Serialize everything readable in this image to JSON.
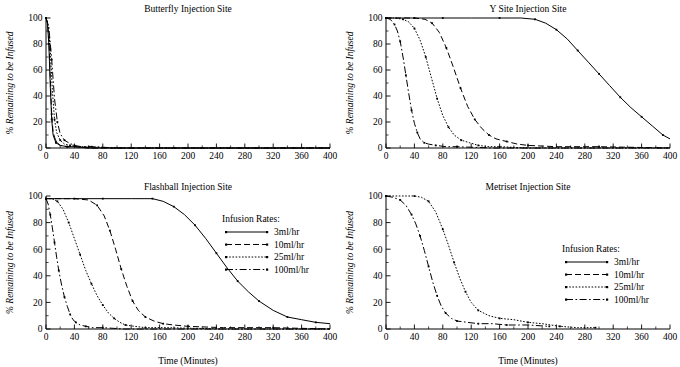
{
  "figure": {
    "xlabel": "Time (Minutes)",
    "ylabel": "% Remaining to be Infused",
    "legend_title": "Infusion Rates:",
    "xticks": [
      0,
      40,
      80,
      120,
      160,
      200,
      240,
      280,
      320,
      360,
      400
    ],
    "yticks": [
      0,
      20,
      40,
      60,
      80,
      100
    ],
    "xlim": [
      0,
      400
    ],
    "ylim": [
      0,
      100
    ],
    "line_color": "#000000"
  },
  "chart_data": [
    {
      "type": "line",
      "title": "Butterfly Injection Site",
      "xlabel": "",
      "ylabel": "% Remaining to be Infused",
      "xlim": [
        0,
        400
      ],
      "ylim": [
        0,
        100
      ],
      "legend_position": "none",
      "grid": false,
      "series": [
        {
          "name": "3ml/hr",
          "style": "solid",
          "x": [
            0,
            2,
            4,
            6,
            8,
            10,
            14,
            20,
            30,
            40,
            60,
            100,
            200,
            300,
            400
          ],
          "y": [
            100,
            96,
            80,
            48,
            22,
            10,
            4,
            2,
            1,
            1,
            0,
            0,
            0,
            0,
            0
          ]
        },
        {
          "name": "10ml/hr",
          "style": "dashed",
          "x": [
            0,
            2,
            4,
            6,
            8,
            10,
            14,
            20,
            30,
            40,
            60,
            100,
            200,
            300,
            400
          ],
          "y": [
            100,
            97,
            85,
            55,
            26,
            12,
            5,
            2,
            1,
            1,
            0,
            0,
            0,
            0,
            0
          ]
        },
        {
          "name": "25ml/hr",
          "style": "dotted",
          "x": [
            0,
            3,
            6,
            9,
            12,
            15,
            20,
            26,
            34,
            44,
            60,
            100,
            200,
            300,
            400
          ],
          "y": [
            100,
            95,
            76,
            44,
            22,
            12,
            6,
            3,
            2,
            1,
            1,
            0,
            0,
            0,
            0
          ]
        },
        {
          "name": "100ml/hr",
          "style": "dashdot",
          "x": [
            0,
            4,
            8,
            12,
            16,
            20,
            26,
            32,
            40,
            50,
            64,
            100,
            200,
            300,
            400
          ],
          "y": [
            100,
            93,
            68,
            38,
            20,
            11,
            6,
            4,
            2,
            1,
            1,
            0,
            0,
            0,
            0
          ]
        }
      ]
    },
    {
      "type": "line",
      "title": "Y Site Injection Site",
      "xlabel": "",
      "ylabel": "% Remaining to be Infused",
      "xlim": [
        0,
        400
      ],
      "ylim": [
        0,
        100
      ],
      "legend_position": "none",
      "grid": false,
      "series": [
        {
          "name": "3ml/hr",
          "style": "solid",
          "x": [
            0,
            40,
            80,
            120,
            160,
            190,
            210,
            225,
            240,
            255,
            270,
            285,
            300,
            315,
            330,
            345,
            360,
            375,
            390,
            400
          ],
          "y": [
            100,
            100,
            100,
            100,
            100,
            100,
            99,
            96,
            91,
            84,
            75,
            66,
            57,
            48,
            39,
            31,
            24,
            17,
            10,
            7
          ]
        },
        {
          "name": "10ml/hr",
          "style": "dashed",
          "x": [
            0,
            20,
            40,
            55,
            65,
            75,
            85,
            95,
            105,
            115,
            125,
            135,
            145,
            155,
            170,
            185,
            200,
            240,
            300,
            400
          ],
          "y": [
            100,
            100,
            100,
            99,
            96,
            89,
            77,
            62,
            46,
            32,
            22,
            15,
            10,
            7,
            5,
            3,
            2,
            1,
            1,
            0
          ]
        },
        {
          "name": "25ml/hr",
          "style": "dotted",
          "x": [
            0,
            12,
            24,
            32,
            40,
            48,
            56,
            64,
            72,
            80,
            88,
            96,
            106,
            118,
            130,
            145,
            160,
            200,
            300,
            400
          ],
          "y": [
            100,
            100,
            99,
            97,
            92,
            83,
            70,
            54,
            38,
            25,
            16,
            10,
            6,
            4,
            2,
            1,
            1,
            0,
            0,
            0
          ]
        },
        {
          "name": "100ml/hr",
          "style": "dashdot",
          "x": [
            0,
            6,
            12,
            16,
            20,
            24,
            28,
            32,
            36,
            40,
            44,
            48,
            54,
            60,
            70,
            85,
            100,
            150,
            250,
            400
          ],
          "y": [
            100,
            99,
            95,
            90,
            82,
            70,
            56,
            42,
            29,
            19,
            12,
            7,
            4,
            3,
            2,
            1,
            1,
            0,
            0,
            0
          ]
        }
      ]
    },
    {
      "type": "line",
      "title": "Flashball Injection Site",
      "xlabel": "Time (Minutes)",
      "ylabel": "% Remaining to be Infused",
      "xlim": [
        0,
        400
      ],
      "ylim": [
        0,
        100
      ],
      "legend_position": "right",
      "grid": false,
      "series": [
        {
          "name": "3ml/hr",
          "style": "solid",
          "x": [
            0,
            40,
            80,
            120,
            150,
            165,
            180,
            195,
            210,
            225,
            240,
            255,
            270,
            285,
            300,
            320,
            340,
            360,
            380,
            400
          ],
          "y": [
            98,
            98,
            98,
            98,
            98,
            96,
            92,
            86,
            78,
            68,
            57,
            46,
            36,
            28,
            21,
            14,
            9,
            7,
            5,
            4
          ]
        },
        {
          "name": "10ml/hr",
          "style": "dashed",
          "x": [
            0,
            20,
            40,
            60,
            72,
            82,
            90,
            98,
            106,
            114,
            122,
            130,
            140,
            152,
            165,
            180,
            200,
            250,
            320,
            400
          ],
          "y": [
            98,
            98,
            98,
            97,
            93,
            85,
            74,
            60,
            45,
            32,
            21,
            14,
            9,
            6,
            4,
            3,
            2,
            1,
            1,
            0
          ]
        },
        {
          "name": "25ml/hr",
          "style": "dotted",
          "x": [
            0,
            8,
            16,
            24,
            32,
            40,
            48,
            56,
            64,
            72,
            80,
            88,
            96,
            104,
            112,
            125,
            140,
            170,
            250,
            400
          ],
          "y": [
            98,
            98,
            96,
            90,
            80,
            68,
            56,
            44,
            34,
            25,
            18,
            12,
            8,
            5,
            3,
            2,
            1,
            1,
            0,
            0
          ]
        },
        {
          "name": "100ml/hr",
          "style": "dashdot",
          "x": [
            0,
            3,
            6,
            9,
            12,
            15,
            18,
            22,
            26,
            30,
            34,
            38,
            42,
            48,
            56,
            66,
            80,
            110,
            200,
            400
          ],
          "y": [
            98,
            94,
            86,
            76,
            65,
            54,
            44,
            33,
            24,
            17,
            11,
            7,
            5,
            3,
            2,
            1,
            1,
            0,
            0,
            0
          ]
        }
      ]
    },
    {
      "type": "line",
      "title": "Metriset Injection Site",
      "xlabel": "Time (Minutes)",
      "ylabel": "% Remaining to be Infused",
      "xlim": [
        0,
        400
      ],
      "ylim": [
        0,
        100
      ],
      "legend_position": "right",
      "grid": false,
      "series": [
        {
          "name": "25ml/hr",
          "style": "dotted",
          "x": [
            0,
            20,
            40,
            50,
            60,
            70,
            80,
            88,
            96,
            104,
            112,
            120,
            130,
            145,
            160,
            180,
            200,
            220,
            245,
            270,
            295
          ],
          "y": [
            100,
            100,
            100,
            99,
            96,
            88,
            75,
            63,
            50,
            38,
            28,
            20,
            14,
            10,
            8,
            7,
            5,
            4,
            2,
            1,
            1
          ]
        },
        {
          "name": "100ml/hr",
          "style": "dashdot",
          "x": [
            0,
            10,
            20,
            28,
            36,
            42,
            48,
            54,
            60,
            66,
            72,
            78,
            84,
            92,
            100,
            115,
            130,
            150,
            170,
            200,
            230
          ],
          "y": [
            100,
            99,
            97,
            93,
            86,
            79,
            70,
            59,
            47,
            35,
            25,
            17,
            12,
            8,
            6,
            5,
            4,
            4,
            3,
            3,
            2
          ]
        }
      ]
    }
  ],
  "legend": {
    "title": "Infusion Rates:",
    "items": [
      {
        "label": "3ml/hr",
        "style": "solid"
      },
      {
        "label": "10ml/hr",
        "style": "dashed"
      },
      {
        "label": "25ml/hr",
        "style": "dotted"
      },
      {
        "label": "100ml/hr",
        "style": "dashdot"
      }
    ]
  }
}
